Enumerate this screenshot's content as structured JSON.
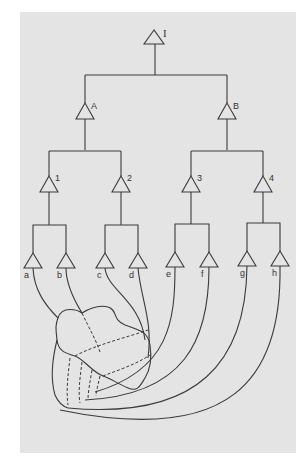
{
  "diagram": {
    "root": {
      "label": "I"
    },
    "level1": [
      {
        "label": "A"
      },
      {
        "label": "B"
      }
    ],
    "level2": [
      {
        "label": "1"
      },
      {
        "label": "2"
      },
      {
        "label": "3"
      },
      {
        "label": "4"
      }
    ],
    "leaves": [
      {
        "label": "a"
      },
      {
        "label": "b"
      },
      {
        "label": "c"
      },
      {
        "label": "d"
      },
      {
        "label": "e"
      },
      {
        "label": "f"
      },
      {
        "label": "g"
      },
      {
        "label": "h"
      }
    ],
    "colors": {
      "background": "#e4e4e4",
      "line": "#3a3a3a",
      "page": "#ffffff"
    }
  }
}
